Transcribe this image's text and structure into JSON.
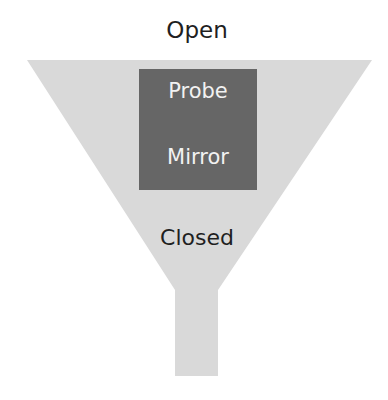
{
  "diagram": {
    "top_label": "Open",
    "bottom_label": "Closed",
    "box": {
      "labels": [
        "Probe",
        "Mirror"
      ],
      "color": "#666666"
    },
    "funnel_color": "#d9d9d9"
  }
}
